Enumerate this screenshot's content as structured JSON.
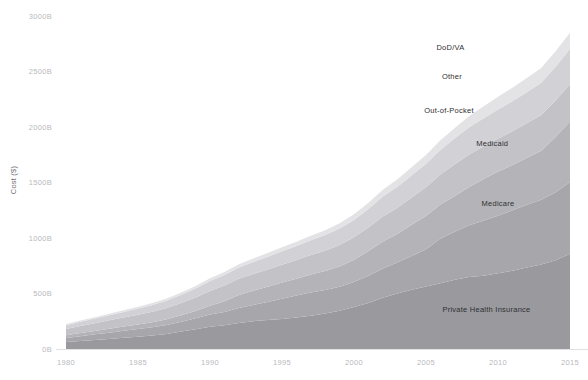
{
  "chart_data": {
    "type": "area",
    "stacked": true,
    "title": "",
    "subtitle": "",
    "xlabel": "",
    "ylabel": "Cost ($)",
    "grid": false,
    "legend_position": "inline-right",
    "xlim": [
      1980,
      2015
    ],
    "ylim": [
      0,
      3000
    ],
    "y_tick_values": [
      0,
      500,
      1000,
      1500,
      2000,
      2500,
      3000
    ],
    "y_tick_labels": [
      "0B",
      "500B",
      "1000B",
      "1500B",
      "2000B",
      "2500B",
      "3000B"
    ],
    "x_tick_values": [
      1980,
      1985,
      1990,
      1995,
      2000,
      2005,
      2010,
      2015
    ],
    "x_tick_labels": [
      "1980",
      "1985",
      "1990",
      "1995",
      "2000",
      "2005",
      "2010",
      "2015"
    ],
    "x": [
      1980,
      1981,
      1982,
      1983,
      1984,
      1985,
      1986,
      1987,
      1988,
      1989,
      1990,
      1991,
      1992,
      1993,
      1994,
      1995,
      1996,
      1997,
      1998,
      1999,
      2000,
      2001,
      2002,
      2003,
      2004,
      2005,
      2006,
      2007,
      2008,
      2009,
      2010,
      2011,
      2012,
      2013,
      2014,
      2015
    ],
    "series": [
      {
        "name": "Private Health Insurance",
        "color": "#9a9a9e",
        "label_x": 2009.2,
        "label_y": 330,
        "values": [
          62,
          72,
          82,
          91,
          101,
          111,
          122,
          136,
          158,
          178,
          201,
          215,
          235,
          251,
          261,
          271,
          283,
          299,
          319,
          344,
          379,
          415,
          461,
          499,
          534,
          563,
          592,
          625,
          648,
          661,
          682,
          704,
          735,
          762,
          800,
          858
        ]
      },
      {
        "name": "Medicare",
        "color": "#a7a7ab",
        "label_x": 2010.0,
        "label_y": 1290,
        "values": [
          36,
          43,
          50,
          56,
          63,
          69,
          75,
          81,
          88,
          99,
          109,
          119,
          134,
          146,
          163,
          182,
          198,
          211,
          213,
          216,
          224,
          244,
          265,
          281,
          303,
          336,
          404,
          432,
          466,
          496,
          519,
          546,
          565,
          583,
          613,
          646
        ]
      },
      {
        "name": "Medicaid",
        "color": "#b4b4b8",
        "label_x": 2009.6,
        "label_y": 1830,
        "values": [
          25,
          29,
          31,
          35,
          38,
          41,
          45,
          51,
          57,
          66,
          79,
          97,
          117,
          127,
          137,
          146,
          153,
          161,
          170,
          183,
          200,
          223,
          243,
          256,
          283,
          299,
          305,
          322,
          345,
          374,
          398,
          407,
          421,
          441,
          496,
          545
        ]
      },
      {
        "name": "Out-of-Pocket",
        "color": "#c3c3c7",
        "label_x": 2006.6,
        "label_y": 2130,
        "values": [
          58,
          64,
          70,
          76,
          82,
          88,
          94,
          102,
          112,
          122,
          134,
          140,
          146,
          151,
          155,
          160,
          167,
          175,
          184,
          194,
          203,
          212,
          225,
          234,
          244,
          259,
          270,
          285,
          294,
          295,
          297,
          305,
          313,
          322,
          330,
          338
        ]
      },
      {
        "name": "Other",
        "color": "#d2d2d6",
        "label_x": 2006.8,
        "label_y": 2430,
        "values": [
          34,
          38,
          42,
          46,
          50,
          55,
          60,
          66,
          73,
          80,
          89,
          96,
          103,
          109,
          115,
          121,
          127,
          133,
          140,
          148,
          157,
          168,
          180,
          190,
          200,
          211,
          222,
          234,
          245,
          253,
          261,
          270,
          280,
          291,
          303,
          316
        ]
      },
      {
        "name": "DoD/VA",
        "color": "#e3e3e6",
        "label_x": 2006.7,
        "label_y": 2690,
        "values": [
          10,
          11,
          12,
          13,
          15,
          16,
          18,
          19,
          21,
          23,
          25,
          27,
          29,
          31,
          34,
          36,
          38,
          41,
          44,
          47,
          51,
          55,
          60,
          66,
          73,
          80,
          87,
          94,
          101,
          108,
          115,
          121,
          127,
          133,
          140,
          147
        ]
      }
    ]
  }
}
